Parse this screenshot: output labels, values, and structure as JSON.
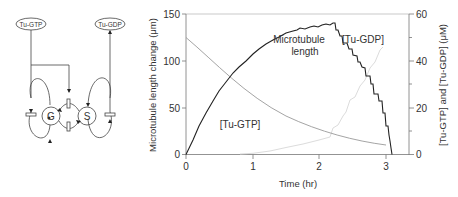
{
  "diagram": {
    "nodes": {
      "tu_gtp": "Tu-GTP",
      "tu_gdp": "Tu-GDP",
      "growing": "G",
      "shrinking": "S"
    }
  },
  "chart_data": {
    "type": "line",
    "title": "",
    "xlabel": "Time (hr)",
    "ylabel": "Microtubule length change (μm)",
    "y2label": "[Tu-GTP] and [Tu-GDP] (μM)",
    "xlim": [
      0,
      3.35
    ],
    "ylim": [
      0,
      150
    ],
    "y2lim": [
      0,
      60
    ],
    "xticks": [
      "0",
      "1",
      "2",
      "3"
    ],
    "yticks": [
      "0",
      "50",
      "100",
      "150"
    ],
    "y2ticks": [
      "0",
      "20",
      "40",
      "60"
    ],
    "grid": false,
    "annotations": [
      "Microtubule length",
      "[Tu-GTP]",
      "[Tu-GDP]"
    ],
    "series": [
      {
        "name": "Microtubule length",
        "axis": "left",
        "color": "#222222",
        "x": [
          0,
          0.1,
          0.2,
          0.3,
          0.4,
          0.5,
          0.6,
          0.7,
          0.8,
          0.9,
          1.0,
          1.1,
          1.2,
          1.3,
          1.4,
          1.5,
          1.6,
          1.7,
          1.8,
          1.9,
          2.0,
          2.1,
          2.2,
          2.25,
          2.3,
          2.35,
          2.45,
          2.5,
          2.6,
          2.65,
          2.7,
          2.75,
          2.78,
          2.85,
          2.9,
          2.95,
          3.0
        ],
        "values": [
          0,
          15,
          30,
          44,
          57,
          68,
          78,
          87,
          94,
          100,
          108,
          113,
          118,
          122,
          126,
          130,
          132,
          133,
          134,
          136,
          137,
          137,
          138,
          130,
          124,
          115,
          108,
          100,
          92,
          88,
          80,
          70,
          55,
          42,
          35,
          20,
          0
        ]
      },
      {
        "name": "[Tu-GTP]",
        "axis": "right",
        "color": "#999999",
        "x": [
          0,
          0.25,
          0.5,
          0.75,
          1.0,
          1.25,
          1.5,
          1.75,
          2.0,
          2.25,
          2.5,
          2.75,
          3.0
        ],
        "values": [
          50,
          42,
          35,
          29,
          24,
          20,
          16.5,
          13.5,
          11,
          8.5,
          6.5,
          5,
          4
        ]
      },
      {
        "name": "[Tu-GDP]",
        "axis": "right",
        "color": "#dddddd",
        "x": [
          0.8,
          1.0,
          1.25,
          1.5,
          1.75,
          2.0,
          2.2,
          2.4,
          2.6,
          2.8,
          2.9
        ],
        "values": [
          0,
          0.5,
          1.5,
          3,
          4.5,
          6,
          12,
          22,
          30,
          38,
          46
        ]
      }
    ]
  }
}
